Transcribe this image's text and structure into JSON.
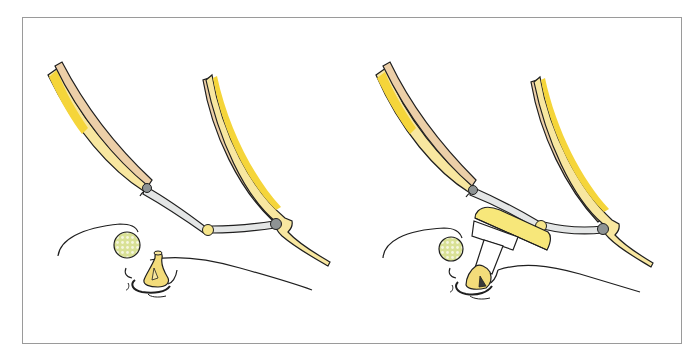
{
  "figure": {
    "type": "anatomical-illustration",
    "panels": [
      {
        "id": "left",
        "label": "",
        "description": "Retractor frame with two blades and hinged connecting arm; small yellow structure below soft tissue line"
      },
      {
        "id": "right",
        "label": "",
        "description": "Same retractor frame with a yellow paddle/plate attachment and white stem contacting the structure below"
      }
    ],
    "colors": {
      "blade_yellow": "#f5d53a",
      "blade_light_yellow": "#f8ecb0",
      "blade_tan": "#eccfa8",
      "arm_gray": "#e4e6e6",
      "joint_gray": "#8e9394",
      "joint_yellow": "#f6e58a",
      "outline": "#1f1f1f",
      "frame_border": "#9a9a9a",
      "dotted_circle_fill": "#dfe6a0",
      "paddle_yellow": "#f7e77a"
    }
  }
}
